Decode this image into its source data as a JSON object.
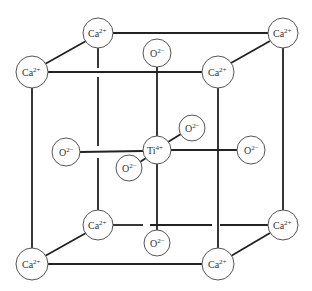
{
  "diagram": {
    "edge_color": "#222222",
    "atom_fill": "#ffffff",
    "atoms": [
      {
        "id": "ca-back-top-left",
        "element": "Ca",
        "charge": "2+",
        "x": 98,
        "y": 33,
        "r": 15
      },
      {
        "id": "ca-back-top-right",
        "element": "Ca",
        "charge": "2+",
        "x": 283,
        "y": 33,
        "r": 15
      },
      {
        "id": "ca-front-top-left",
        "element": "Ca",
        "charge": "2+",
        "x": 32,
        "y": 72,
        "r": 16
      },
      {
        "id": "ca-front-top-right",
        "element": "Ca",
        "charge": "2+",
        "x": 218,
        "y": 72,
        "r": 16
      },
      {
        "id": "o-top",
        "element": "O",
        "charge": "2−",
        "x": 157,
        "y": 53,
        "r": 14
      },
      {
        "id": "o-left",
        "element": "O",
        "charge": "2−",
        "x": 66,
        "y": 152,
        "r": 14
      },
      {
        "id": "ti-center",
        "element": "Ti",
        "charge": "4+",
        "x": 157,
        "y": 150,
        "r": 14
      },
      {
        "id": "o-back",
        "element": "O",
        "charge": "2−",
        "x": 192,
        "y": 128,
        "r": 13
      },
      {
        "id": "o-front",
        "element": "O",
        "charge": "2−",
        "x": 129,
        "y": 168,
        "r": 13
      },
      {
        "id": "o-right",
        "element": "O",
        "charge": "2−",
        "x": 251,
        "y": 150,
        "r": 14
      },
      {
        "id": "ca-back-bottom-left",
        "element": "Ca",
        "charge": "2+",
        "x": 98,
        "y": 225,
        "r": 15
      },
      {
        "id": "ca-back-bottom-right",
        "element": "Ca",
        "charge": "2+",
        "x": 283,
        "y": 225,
        "r": 15
      },
      {
        "id": "o-bottom",
        "element": "O",
        "charge": "2−",
        "x": 157,
        "y": 243,
        "r": 13
      },
      {
        "id": "ca-front-bottom-left",
        "element": "Ca",
        "charge": "2+",
        "x": 32,
        "y": 264,
        "r": 16
      },
      {
        "id": "ca-front-bottom-right",
        "element": "Ca",
        "charge": "2+",
        "x": 218,
        "y": 264,
        "r": 16
      }
    ]
  }
}
